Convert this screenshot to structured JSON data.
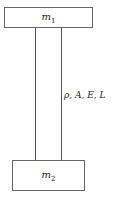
{
  "diagram": {
    "top_mass": {
      "symbol": "m",
      "subscript": "1"
    },
    "bottom_mass": {
      "symbol": "m",
      "subscript": "2"
    },
    "rod_label": "ρ, A, E, L"
  }
}
